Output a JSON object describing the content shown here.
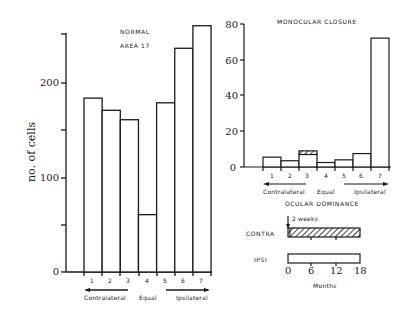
{
  "chart_data": [
    {
      "type": "bar",
      "title": "NORMAL",
      "subtitle": "AREA 17",
      "categories": [
        "1",
        "2",
        "3",
        "4",
        "5",
        "6",
        "7"
      ],
      "values": [
        185,
        172,
        162,
        61,
        180,
        238,
        262
      ],
      "xlabel": "",
      "ylabel": "no. of cells",
      "ylim": [
        0,
        250
      ],
      "yticks": [
        0,
        50,
        100,
        150,
        200,
        250
      ],
      "ytick_labels": [
        "0",
        "",
        "100",
        "",
        "200",
        ""
      ],
      "group_labels": [
        {
          "label": "Contralateral",
          "range": [
            "1",
            "3"
          ],
          "arrow": "left"
        },
        {
          "label": "Equal",
          "range": [
            "4",
            "4"
          ]
        },
        {
          "label": "Ipsilateral",
          "range": [
            "5",
            "7"
          ],
          "arrow": "right"
        }
      ],
      "grid": false,
      "legend": null
    },
    {
      "type": "bar",
      "title": "MONOCULAR CLOSURE",
      "categories": [
        "1",
        "2",
        "3",
        "4",
        "5",
        "6",
        "7"
      ],
      "values": [
        5.5,
        3.5,
        9,
        2.5,
        4,
        7.5,
        72
      ],
      "series": [
        {
          "name": "open",
          "values": [
            5.5,
            3.5,
            7,
            2.5,
            4,
            7.5,
            72
          ]
        },
        {
          "name": "hatched",
          "values": [
            0,
            0,
            2,
            0,
            0,
            0,
            0
          ]
        }
      ],
      "xlabel": "",
      "ylabel": "",
      "ylim": [
        0,
        80
      ],
      "yticks": [
        0,
        20,
        40,
        60,
        80
      ],
      "group_labels": [
        {
          "label": "Contralateral",
          "range": [
            "1",
            "3"
          ],
          "arrow": "left"
        },
        {
          "label": "Equal",
          "range": [
            "4",
            "4"
          ]
        },
        {
          "label": "Ipsilateral",
          "range": [
            "5",
            "7"
          ],
          "arrow": "right"
        }
      ],
      "grid": false,
      "legend": null
    },
    {
      "type": "bar",
      "title": "OCULAR DOMINANCE",
      "orientation": "horizontal",
      "categories": [
        "CONTRA",
        "IPSI"
      ],
      "series": [
        {
          "name": "CONTRA",
          "start": 0,
          "end": 18,
          "fill": "hatched"
        },
        {
          "name": "IPSI",
          "start": 0,
          "end": 18,
          "fill": "open"
        }
      ],
      "annotation": "2 weeks",
      "xlabel": "Months",
      "xlim": [
        0,
        18
      ],
      "xticks": [
        0,
        6,
        12,
        18
      ]
    }
  ],
  "left": {
    "title": "NORMAL",
    "subtitle": "AREA 17",
    "ylabel": "no. of cells",
    "yticks": [
      "0",
      "100",
      "200"
    ],
    "cats": [
      "1",
      "2",
      "3",
      "4",
      "5",
      "6",
      "7"
    ],
    "groups": {
      "contra": "Contralateral",
      "equal": "Equal",
      "ipsi": "Ipsilateral"
    }
  },
  "right": {
    "title": "MONOCULAR CLOSURE",
    "yticks": [
      "0",
      "20",
      "40",
      "60",
      "80"
    ],
    "cats": [
      "1",
      "2",
      "3",
      "4",
      "5",
      "6",
      "7"
    ],
    "groups": {
      "contra": "Contralateral",
      "equal": "Equal",
      "ipsi": "Ipsilateral"
    }
  },
  "timeline": {
    "title": "OCULAR DOMINANCE",
    "annotation": "2 weeks",
    "rows": [
      "CONTRA",
      "IPSI"
    ],
    "xticks": [
      "0",
      "6",
      "12",
      "18"
    ],
    "xlabel": "Months"
  },
  "colors": {
    "ink": "#1a1a1a",
    "paper": "#ffffff"
  }
}
